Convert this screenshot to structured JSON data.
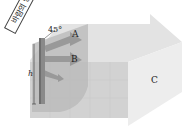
{
  "diagram": {
    "labels": {
      "wind_direction": "바람의 방향",
      "angle": "45°",
      "arrow_a": "A",
      "arrow_b": "B",
      "arrow_c": "C",
      "height": "h"
    },
    "colors": {
      "box_top": "#e2e2e2",
      "box_front": "#cfcfcf",
      "box_side": "#ececec",
      "arrow_head": "#d8d8d8",
      "panel": "#b9b9b9",
      "pipe": "#8a8a8a",
      "arrows_ab": "#9a9a9a"
    }
  }
}
